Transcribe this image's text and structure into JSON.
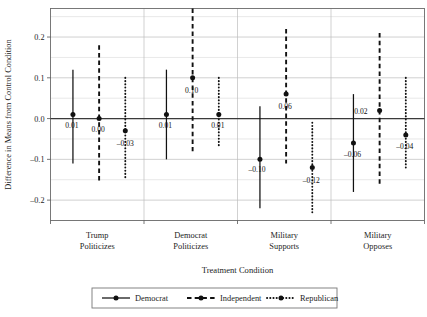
{
  "chart_data": {
    "type": "scatter",
    "title": "",
    "xlabel": "Treatment Condition",
    "ylabel": "Difference in Means from Control Condition",
    "categories": [
      "Trump Politicizes",
      "Democrat Politicizes",
      "Military Supports",
      "Military Opposes"
    ],
    "category_lines": [
      [
        "Trump",
        "Politicizes"
      ],
      [
        "Democrat",
        "Politicizes"
      ],
      [
        "Military",
        "Supports"
      ],
      [
        "Military",
        "Opposes"
      ]
    ],
    "ylim": [
      -0.25,
      0.27
    ],
    "yticks": [
      0.2,
      0.1,
      0.0,
      -0.1,
      -0.2
    ],
    "ytick_labels": [
      "0.2",
      "0.1",
      "0.0",
      "–0.1",
      "–0.2"
    ],
    "gridlines": [
      0.25,
      0.2,
      0.15,
      0.1,
      0.05,
      0.0,
      -0.05,
      -0.1,
      -0.15,
      -0.2,
      -0.25
    ],
    "grid": true,
    "zero_reference_line": 0.0,
    "legend_position": "bottom",
    "series": [
      {
        "name": "Democrat",
        "linestyle": "solid",
        "color": "#111111",
        "values": [
          0.01,
          0.01,
          -0.1,
          -0.06
        ],
        "labels": [
          "0.01",
          "0.01",
          "–0.10",
          "–0.06"
        ],
        "ci_low": [
          -0.11,
          -0.1,
          -0.22,
          -0.18
        ],
        "ci_high": [
          0.12,
          0.12,
          0.03,
          0.06
        ]
      },
      {
        "name": "Independent",
        "linestyle": "dashed",
        "color": "#111111",
        "values": [
          0.0,
          0.1,
          0.06,
          0.02
        ],
        "labels": [
          "0.00",
          "0.10",
          "0.06",
          "0.02"
        ],
        "ci_low": [
          -0.16,
          -0.08,
          -0.11,
          -0.16
        ],
        "ci_high": [
          0.18,
          0.27,
          0.22,
          0.21
        ]
      },
      {
        "name": "Republican",
        "linestyle": "dotted",
        "color": "#111111",
        "values": [
          -0.03,
          0.01,
          -0.12,
          -0.04
        ],
        "labels": [
          "–0.03",
          "0.01",
          "–0.12",
          "–0.04"
        ],
        "ci_low": [
          -0.15,
          -0.07,
          -0.23,
          -0.12
        ],
        "ci_high": [
          0.1,
          0.1,
          -0.01,
          0.1
        ]
      }
    ],
    "legend_entries": [
      {
        "label": "Democrat",
        "linestyle": "solid"
      },
      {
        "label": "Independent",
        "linestyle": "dashed"
      },
      {
        "label": "Republican",
        "linestyle": "dotted"
      }
    ]
  }
}
